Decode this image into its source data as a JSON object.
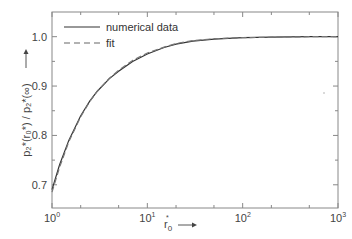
{
  "chart_data": {
    "type": "line",
    "title": "",
    "xlabel": "r0* →",
    "ylabel": "p2*(r0*)/p2*(∞) →",
    "xscale": "log",
    "xlim": [
      1,
      1000
    ],
    "ylim": [
      0.653,
      1.05
    ],
    "grid": false,
    "legend_position": "upper left",
    "x_ticks": [
      "10^0",
      "10^1",
      "10^2",
      "10^3"
    ],
    "y_ticks": [
      "0.7",
      "0.8",
      "0.9",
      "1.0"
    ],
    "series": [
      {
        "name": "numerical data",
        "style": "solid",
        "x": [
          1,
          1.2,
          1.5,
          2,
          2.5,
          3,
          4,
          5,
          7,
          10,
          15,
          20,
          30,
          50,
          100,
          200,
          500,
          1000
        ],
        "y": [
          0.69,
          0.74,
          0.79,
          0.84,
          0.87,
          0.89,
          0.915,
          0.93,
          0.95,
          0.965,
          0.978,
          0.985,
          0.991,
          0.995,
          0.998,
          0.999,
          1.0,
          1.0
        ]
      },
      {
        "name": "fit",
        "style": "dashed",
        "x": [
          1,
          1.2,
          1.5,
          2,
          2.5,
          3,
          4,
          5,
          7,
          10,
          15,
          20,
          30,
          50,
          100,
          200,
          500,
          1000
        ],
        "y": [
          0.685,
          0.735,
          0.787,
          0.838,
          0.869,
          0.89,
          0.916,
          0.932,
          0.952,
          0.967,
          0.979,
          0.986,
          0.992,
          0.996,
          0.998,
          0.999,
          1.0,
          1.0
        ]
      }
    ]
  },
  "legend": {
    "items": [
      {
        "label": "numerical data"
      },
      {
        "label": "fit"
      }
    ]
  },
  "axes": {
    "x_ticks": [
      {
        "base": "10",
        "exp": "0"
      },
      {
        "base": "10",
        "exp": "1"
      },
      {
        "base": "10",
        "exp": "2"
      },
      {
        "base": "10",
        "exp": "3"
      }
    ],
    "y_ticks": [
      "0.7",
      "0.8",
      "0.9",
      "1.0"
    ],
    "x_label_main": "r",
    "x_label_sub": "0",
    "x_label_sup": "*",
    "y_label": "p₂*(r₀*) / p₂*(∞)"
  }
}
